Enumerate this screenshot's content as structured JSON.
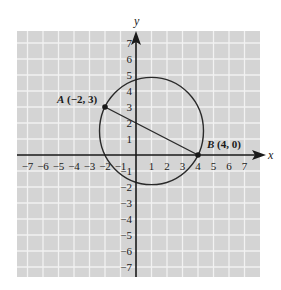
{
  "figure": {
    "type": "coordinate-plane",
    "x_axis_label": "x",
    "y_axis_label": "y",
    "x_range": [
      -7,
      7
    ],
    "y_range": [
      -7,
      7
    ],
    "x_ticks": [
      "−7",
      "−6",
      "−5",
      "−4",
      "−3",
      "−2",
      "−1",
      "1",
      "2",
      "3",
      "4",
      "5",
      "6",
      "7"
    ],
    "y_ticks": [
      "7",
      "6",
      "5",
      "4",
      "3",
      "2",
      "1",
      "−1",
      "−2",
      "−3",
      "−4",
      "−5",
      "−6",
      "−7"
    ],
    "points": [
      {
        "name": "A",
        "coords": "(−2, 3)",
        "x": -2,
        "y": 3
      },
      {
        "name": "B",
        "coords": "(4, 0)",
        "x": 4,
        "y": 0
      }
    ],
    "segment": {
      "from": "A",
      "to": "B"
    },
    "circle": {
      "center_x": 1,
      "center_y": 1.5,
      "radius": 3.354,
      "description": "circle with diameter AB"
    },
    "colors": {
      "grid_background": "#d4d4d4",
      "grid_lines": "#f2f2f2",
      "axis": "#1a1a1a",
      "curve": "#2a2a2a"
    }
  }
}
